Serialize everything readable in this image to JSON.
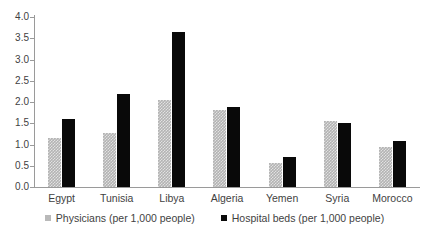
{
  "chart_data": {
    "type": "bar",
    "title": "",
    "subtitle": "",
    "xlabel": "",
    "ylabel": "",
    "ylim": [
      0.0,
      4.0
    ],
    "ytick_labels": [
      "4.0",
      "3.5",
      "3.0",
      "2.5",
      "2.0",
      "1.5",
      "1.0",
      "0.5",
      "0.0"
    ],
    "ytick_values": [
      4.0,
      3.5,
      3.0,
      2.5,
      2.0,
      1.5,
      1.0,
      0.5,
      0.0
    ],
    "grid": false,
    "legend_position": "bottom",
    "categories": [
      "Egypt",
      "Tunisia",
      "Libya",
      "Algeria",
      "Yemen",
      "Syria",
      "Morocco"
    ],
    "series": [
      {
        "name": "Physicians (per 1,000 people)",
        "color": "#b3b3b3",
        "values": [
          1.15,
          1.28,
          2.05,
          1.82,
          0.56,
          1.55,
          0.93
        ]
      },
      {
        "name": "Hospital beds (per 1,000 people)",
        "color": "#090909",
        "values": [
          1.6,
          2.18,
          3.65,
          1.88,
          0.7,
          1.5,
          1.09
        ]
      }
    ]
  },
  "legend": {
    "items": [
      {
        "label": "Physicians (per 1,000 people)",
        "swatch": "physicians"
      },
      {
        "label": "Hospital beds (per 1,000 people)",
        "swatch": "beds"
      }
    ]
  },
  "colors": {
    "physicians": "#b3b3b3",
    "hospital_beds": "#090909",
    "axis": "#9a9a9a",
    "text": "#3f3f3f",
    "background": "#ffffff"
  }
}
